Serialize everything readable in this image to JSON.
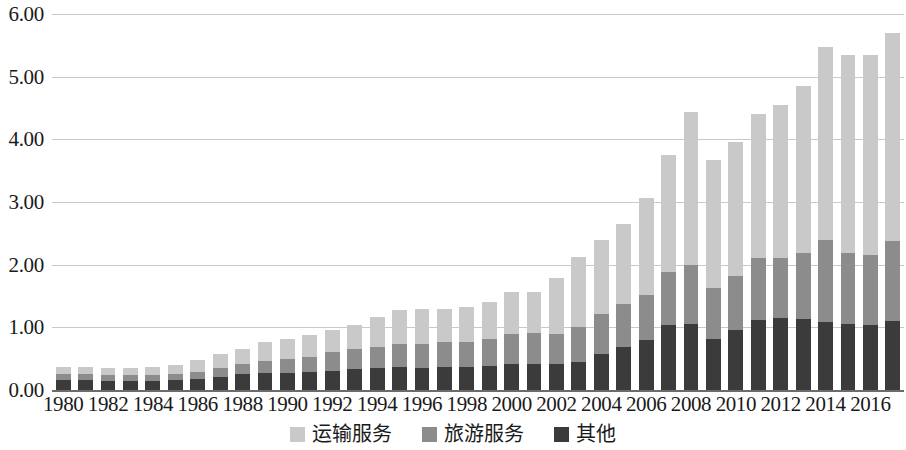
{
  "chart_data": {
    "type": "bar",
    "stacked": true,
    "title": "",
    "subtitle": "",
    "xlabel": "",
    "ylabel": "",
    "ylim": [
      0.0,
      6.0
    ],
    "yticks": [
      0.0,
      1.0,
      2.0,
      3.0,
      4.0,
      5.0,
      6.0
    ],
    "ytick_labels": [
      "0.00",
      "1.00",
      "2.00",
      "3.00",
      "4.00",
      "5.00",
      "6.00"
    ],
    "grid": true,
    "grid_axis": "y",
    "legend_position": "bottom-center",
    "categories": [
      "1980",
      "1981",
      "1982",
      "1983",
      "1984",
      "1985",
      "1986",
      "1987",
      "1988",
      "1989",
      "1990",
      "1991",
      "1992",
      "1993",
      "1994",
      "1995",
      "1996",
      "1997",
      "1998",
      "1999",
      "2000",
      "2001",
      "2002",
      "2003",
      "2004",
      "2005",
      "2006",
      "2007",
      "2008",
      "2009",
      "2010",
      "2011",
      "2012",
      "2013",
      "2014",
      "2015",
      "2016",
      "2017"
    ],
    "xtick_labels": [
      "1980",
      "1982",
      "1984",
      "1986",
      "1988",
      "1990",
      "1992",
      "1994",
      "1996",
      "1998",
      "2000",
      "2002",
      "2004",
      "2006",
      "2008",
      "2010",
      "2012",
      "2014",
      "2016"
    ],
    "series": [
      {
        "name": "其他",
        "color": "#3b3b3b",
        "values": [
          0.16,
          0.16,
          0.15,
          0.15,
          0.15,
          0.16,
          0.17,
          0.21,
          0.25,
          0.27,
          0.27,
          0.28,
          0.31,
          0.34,
          0.35,
          0.36,
          0.35,
          0.36,
          0.36,
          0.38,
          0.41,
          0.41,
          0.41,
          0.45,
          0.58,
          0.68,
          0.8,
          1.04,
          1.06,
          0.82,
          0.96,
          1.12,
          1.15,
          1.13,
          1.08,
          1.06,
          1.04,
          1.1
        ]
      },
      {
        "name": "旅游服务",
        "color": "#8c8c8c",
        "values": [
          0.09,
          0.09,
          0.09,
          0.09,
          0.09,
          0.1,
          0.11,
          0.14,
          0.16,
          0.19,
          0.22,
          0.25,
          0.29,
          0.31,
          0.34,
          0.38,
          0.39,
          0.4,
          0.41,
          0.43,
          0.48,
          0.5,
          0.49,
          0.55,
          0.63,
          0.7,
          0.72,
          0.85,
          0.94,
          0.81,
          0.86,
          0.99,
          0.96,
          1.06,
          1.32,
          1.12,
          1.12,
          1.28
        ]
      },
      {
        "name": "运输服务",
        "color": "#c9c9c9",
        "values": [
          0.11,
          0.11,
          0.11,
          0.11,
          0.12,
          0.14,
          0.2,
          0.22,
          0.25,
          0.3,
          0.32,
          0.35,
          0.36,
          0.38,
          0.48,
          0.53,
          0.56,
          0.54,
          0.55,
          0.6,
          0.67,
          0.66,
          0.88,
          1.13,
          1.18,
          1.27,
          1.55,
          1.86,
          2.44,
          2.04,
          2.14,
          2.3,
          2.43,
          2.66,
          3.08,
          3.16,
          3.18,
          3.31
        ]
      }
    ],
    "totals": [
      0.36,
      0.36,
      0.35,
      0.35,
      0.36,
      0.4,
      0.48,
      0.57,
      0.66,
      0.76,
      0.81,
      0.88,
      0.96,
      1.03,
      1.17,
      1.27,
      1.3,
      1.3,
      1.32,
      1.41,
      1.56,
      1.57,
      1.78,
      2.13,
      2.39,
      2.65,
      3.07,
      3.75,
      4.44,
      3.67,
      3.96,
      4.41,
      4.54,
      4.85,
      5.48,
      5.34,
      5.34,
      5.69
    ],
    "legend": [
      {
        "label": "运输服务",
        "color": "#c9c9c9"
      },
      {
        "label": "旅游服务",
        "color": "#8c8c8c"
      },
      {
        "label": "其他",
        "color": "#3b3b3b"
      }
    ],
    "colors": {
      "transport": "#c9c9c9",
      "tourism": "#8c8c8c",
      "other": "#3b3b3b",
      "gridline": "#c9c9c9",
      "axis": "#6b6b6b",
      "text": "#1a1a1a",
      "background": "#ffffff"
    }
  }
}
